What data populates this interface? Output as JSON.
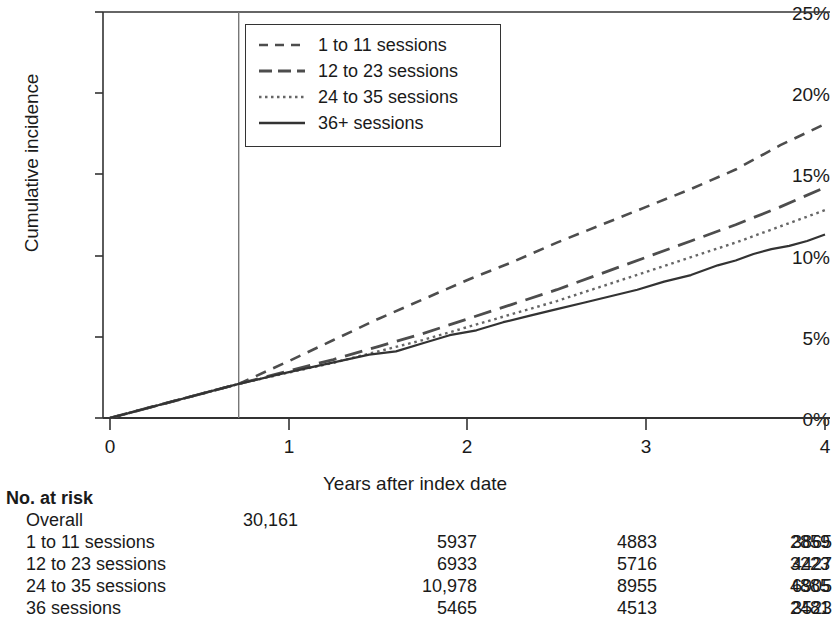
{
  "chart_data": {
    "type": "line",
    "title": "",
    "xlabel": "Years after index date",
    "ylabel": "Cumulative incidence",
    "xlim": [
      0,
      4
    ],
    "ylim": [
      0,
      25
    ],
    "xticks": [
      "0",
      "1",
      "2",
      "3",
      "4"
    ],
    "yticks": [
      "0%",
      "5%",
      "10%",
      "15%",
      "20%",
      "25%"
    ],
    "grid": false,
    "legend_position": "top-center",
    "annotations": [
      {
        "type": "vertical-reference-line",
        "x": 0.72
      }
    ],
    "series": [
      {
        "name": "1 to 11 sessions",
        "style": "dashed",
        "color": "#4d4d4d",
        "x": [
          0,
          0.72,
          1.0,
          1.25,
          1.5,
          1.75,
          2.0,
          2.25,
          2.5,
          2.75,
          3.0,
          3.25,
          3.5,
          3.75,
          4.0
        ],
        "y": [
          0.0,
          2.1,
          3.5,
          4.8,
          6.1,
          7.3,
          8.5,
          9.6,
          10.8,
          11.9,
          13.0,
          14.1,
          15.3,
          16.8,
          18.1
        ]
      },
      {
        "name": "12 to 23 sessions",
        "style": "long-dash",
        "color": "#4d4d4d",
        "x": [
          0,
          0.72,
          1.0,
          1.25,
          1.5,
          1.75,
          2.0,
          2.25,
          2.5,
          2.75,
          3.0,
          3.25,
          3.5,
          3.75,
          4.0
        ],
        "y": [
          0.0,
          2.1,
          2.9,
          3.6,
          4.4,
          5.2,
          6.1,
          7.0,
          7.9,
          8.9,
          9.9,
          10.9,
          11.9,
          13.0,
          14.2
        ]
      },
      {
        "name": "24 to 35 sessions",
        "style": "dotted",
        "color": "#666666",
        "x": [
          0,
          0.72,
          1.0,
          1.25,
          1.5,
          1.75,
          2.0,
          2.25,
          2.5,
          2.75,
          3.0,
          3.25,
          3.5,
          3.75,
          4.0
        ],
        "y": [
          0.0,
          2.1,
          2.8,
          3.4,
          4.1,
          4.8,
          5.6,
          6.4,
          7.2,
          8.1,
          9.0,
          9.9,
          10.8,
          11.8,
          12.8
        ]
      },
      {
        "name": "36+ sessions",
        "style": "solid",
        "color": "#333333",
        "x": [
          0,
          0.72,
          0.95,
          1.2,
          1.45,
          1.6,
          1.75,
          1.9,
          2.05,
          2.2,
          2.35,
          2.5,
          2.65,
          2.8,
          2.95,
          3.1,
          3.25,
          3.4,
          3.5,
          3.6,
          3.7,
          3.8,
          3.9,
          4.0
        ],
        "y": [
          0.0,
          2.1,
          2.7,
          3.3,
          3.9,
          4.1,
          4.6,
          5.1,
          5.4,
          5.9,
          6.3,
          6.7,
          7.1,
          7.5,
          7.9,
          8.4,
          8.8,
          9.4,
          9.7,
          10.1,
          10.4,
          10.6,
          10.9,
          11.3
        ]
      }
    ]
  },
  "legend": {
    "items": [
      {
        "label": "1 to 11 sessions",
        "style": "dashed"
      },
      {
        "label": "12 to 23 sessions",
        "style": "long-dash"
      },
      {
        "label": "24 to 35 sessions",
        "style": "dotted"
      },
      {
        "label": "36+ sessions",
        "style": "solid"
      }
    ]
  },
  "risk_table": {
    "title": "No. at risk",
    "rows": [
      {
        "name": "Overall",
        "values": [
          "30,161",
          "",
          "",
          "",
          ""
        ]
      },
      {
        "name": "1 to 11 sessions",
        "values": [
          "",
          "5937",
          "4883",
          "3865",
          "2859"
        ]
      },
      {
        "name": "12 to 23 sessions",
        "values": [
          "",
          "6933",
          "5716",
          "4427",
          "3223"
        ]
      },
      {
        "name": "24 to 35 sessions",
        "values": [
          "",
          "10,978",
          "8955",
          "6905",
          "4885"
        ]
      },
      {
        "name": "36 sessions",
        "values": [
          "",
          "5465",
          "4513",
          "3523",
          "2481"
        ]
      }
    ]
  }
}
